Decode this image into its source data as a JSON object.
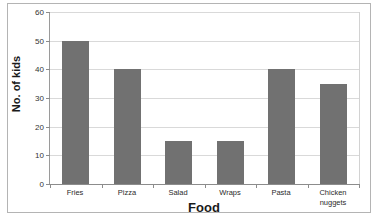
{
  "chart_data": {
    "type": "bar",
    "title": "",
    "xlabel": "Food",
    "ylabel": "No. of kids",
    "categories": [
      "Fries",
      "Pizza",
      "Salad",
      "Wraps",
      "Pasta",
      "Chicken nuggets"
    ],
    "category_lines": [
      [
        "Fries"
      ],
      [
        "Pizza"
      ],
      [
        "Salad"
      ],
      [
        "Wraps"
      ],
      [
        "Pasta"
      ],
      [
        "Chicken",
        "nuggets"
      ]
    ],
    "values": [
      50,
      40,
      15,
      15,
      40,
      35
    ],
    "ylim": [
      0,
      60
    ],
    "ytick_labels": [
      "0",
      "10",
      "20",
      "30",
      "40",
      "50",
      "60"
    ],
    "ytick_values": [
      0,
      10,
      20,
      30,
      40,
      50,
      60
    ],
    "grid": "horizontal",
    "legend": "none",
    "bar_color": "#717171",
    "gridline_color": "#d9d9d9",
    "axis_color": "#8c8c8c"
  }
}
